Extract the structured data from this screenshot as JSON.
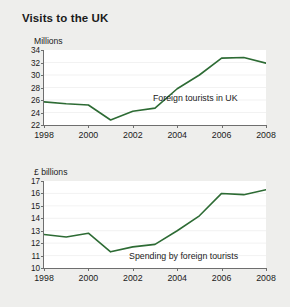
{
  "title": "Visits to the UK",
  "colors": {
    "background": "#eeeeec",
    "plot_background": "#ffffff",
    "line": "#2d6b34",
    "grid": "#d9d9d9",
    "axis": "#6e6e6e",
    "text": "#1b1b1b"
  },
  "chart_data": [
    {
      "type": "line",
      "title": "Visits to the UK",
      "series_label": "Foreign tourists in UK",
      "xlabel": "",
      "ylabel": "Millions",
      "xlim": [
        1998,
        2008
      ],
      "ylim": [
        22,
        34
      ],
      "ytick_step": 2,
      "yticks": [
        34,
        32,
        30,
        28,
        26,
        24,
        22
      ],
      "xticks": [
        1998,
        2000,
        2002,
        2004,
        2006,
        2008
      ],
      "xtick_labels": [
        "1998",
        "2000",
        "2002",
        "2004",
        "2006",
        "2008"
      ],
      "grid": true,
      "legend": "inline-annotation",
      "x": [
        1998,
        1999,
        2000,
        2001,
        2002,
        2003,
        2004,
        2005,
        2006,
        2007,
        2008
      ],
      "values": [
        25.7,
        25.4,
        25.2,
        22.8,
        24.2,
        24.7,
        27.8,
        30.0,
        32.7,
        32.8,
        31.9
      ]
    },
    {
      "type": "line",
      "title": "Visits to the UK",
      "series_label": "Spending by foreign tourists",
      "xlabel": "",
      "ylabel": "£ billions",
      "xlim": [
        1998,
        2008
      ],
      "ylim": [
        10,
        17
      ],
      "ytick_step": 1,
      "yticks": [
        17,
        16,
        15,
        14,
        13,
        12,
        11,
        10
      ],
      "xticks": [
        1998,
        2000,
        2002,
        2004,
        2006,
        2008
      ],
      "xtick_labels": [
        "1998",
        "2000",
        "2002",
        "2004",
        "2006",
        "2008"
      ],
      "grid": true,
      "legend": "inline-annotation",
      "x": [
        1998,
        1999,
        2000,
        2001,
        2002,
        2003,
        2004,
        2005,
        2006,
        2007,
        2008
      ],
      "values": [
        12.7,
        12.5,
        12.8,
        11.3,
        11.7,
        11.9,
        13.0,
        14.2,
        16.0,
        15.9,
        16.3
      ]
    }
  ],
  "top_chart": {
    "axis_title": "Millions",
    "series_label": "Foreign tourists in UK",
    "yticks": [
      "34",
      "32",
      "30",
      "28",
      "26",
      "24",
      "22"
    ],
    "xticks": [
      "1998",
      "2000",
      "2002",
      "2004",
      "2006",
      "2008"
    ]
  },
  "bottom_chart": {
    "axis_title": "£ billions",
    "series_label": "Spending by foreign tourists",
    "yticks": [
      "17",
      "16",
      "15",
      "14",
      "13",
      "12",
      "11",
      "10"
    ],
    "xticks": [
      "1998",
      "2000",
      "2002",
      "2004",
      "2006",
      "2008"
    ]
  }
}
